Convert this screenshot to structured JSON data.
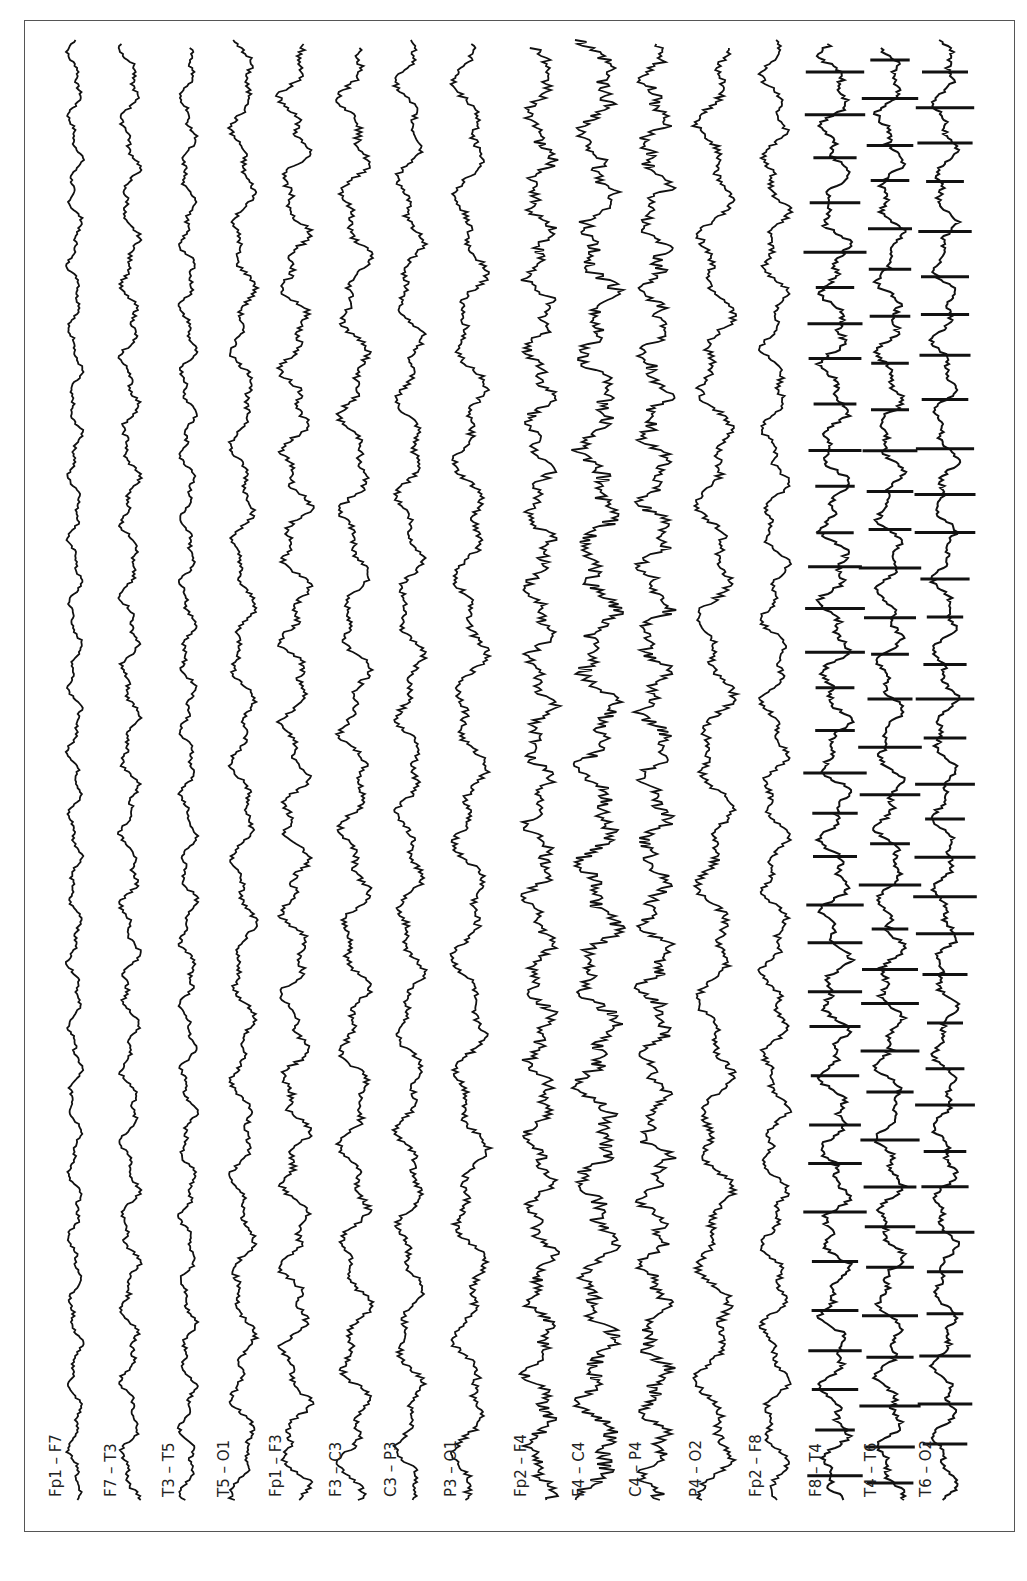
{
  "figure": {
    "type": "EEG bipolar montage recording (rotated 90°)",
    "background": "#ffffff",
    "trace_color": "#111111",
    "frame_color": "#555555"
  },
  "channels": [
    {
      "label": "Fp1 – F7",
      "x": 75,
      "pattern": "low",
      "amp": 6,
      "freq": 0.09,
      "label_y": 1497
    },
    {
      "label": "F7 – T3",
      "x": 130,
      "pattern": "low",
      "amp": 8,
      "freq": 0.08,
      "label_y": 1497
    },
    {
      "label": "T3 – T5",
      "x": 188,
      "pattern": "low",
      "amp": 7,
      "freq": 0.09,
      "label_y": 1497
    },
    {
      "label": "T5 – O1",
      "x": 243,
      "pattern": "mid",
      "amp": 8,
      "freq": 0.06,
      "label_y": 1497
    },
    {
      "label": "Fp1 – F3",
      "x": 295,
      "pattern": "mid",
      "amp": 10,
      "freq": 0.07,
      "label_y": 1497
    },
    {
      "label": "F3 – C3",
      "x": 355,
      "pattern": "mid",
      "amp": 10,
      "freq": 0.06,
      "label_y": 1497
    },
    {
      "label": "C3 – P3",
      "x": 410,
      "pattern": "mid",
      "amp": 9,
      "freq": 0.06,
      "label_y": 1497
    },
    {
      "label": "P3 – O1",
      "x": 470,
      "pattern": "mid",
      "amp": 11,
      "freq": 0.05,
      "label_y": 1497
    },
    {
      "label": "Fp2 – F4",
      "x": 540,
      "pattern": "fast",
      "amp": 9,
      "freq": 0.08,
      "label_y": 1497
    },
    {
      "label": "F4 – C4",
      "x": 598,
      "pattern": "fast",
      "amp": 12,
      "freq": 0.06,
      "label_y": 1497
    },
    {
      "label": "C4 – P4",
      "x": 655,
      "pattern": "fast",
      "amp": 10,
      "freq": 0.09,
      "label_y": 1497
    },
    {
      "label": "P4 – O2",
      "x": 715,
      "pattern": "mid",
      "amp": 12,
      "freq": 0.05,
      "label_y": 1497
    },
    {
      "label": "Fp2 – F8",
      "x": 775,
      "pattern": "mid",
      "amp": 9,
      "freq": 0.07,
      "label_y": 1497
    },
    {
      "label": "F8 – T4",
      "x": 835,
      "pattern": "spike",
      "amp": 10,
      "freq": 0.08,
      "label_y": 1497
    },
    {
      "label": "T4 – T6",
      "x": 890,
      "pattern": "spike",
      "amp": 9,
      "freq": 0.08,
      "label_y": 1497
    },
    {
      "label": "T6 – O2",
      "x": 945,
      "pattern": "spike",
      "amp": 8,
      "freq": 0.08,
      "label_y": 1497
    }
  ],
  "trace_range": {
    "top": 40,
    "bottom": 1510
  },
  "spike_interval": 40
}
